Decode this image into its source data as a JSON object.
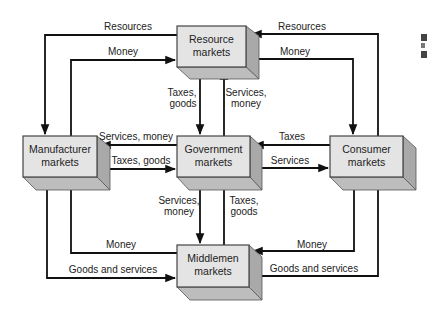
{
  "diagram": {
    "type": "flow",
    "nodes": {
      "resource": {
        "line1": "Resource",
        "line2": "markets"
      },
      "manufacturer": {
        "line1": "Manufacturer",
        "line2": "markets"
      },
      "government": {
        "line1": "Government",
        "line2": "markets"
      },
      "consumer": {
        "line1": "Consumer",
        "line2": "markets"
      },
      "middlemen": {
        "line1": "Middlemen",
        "line2": "markets"
      }
    },
    "edges": {
      "res_to_manu": {
        "label": "Resources",
        "from": "Resource markets",
        "to": "Manufacturer markets"
      },
      "manu_to_res": {
        "label": "Money",
        "from": "Manufacturer markets",
        "to": "Resource markets"
      },
      "cons_to_res": {
        "label": "Resources",
        "from": "Consumer markets",
        "to": "Resource markets"
      },
      "res_to_cons": {
        "label": "Money",
        "from": "Resource markets",
        "to": "Consumer markets"
      },
      "res_to_gov": {
        "line1": "Taxes,",
        "line2": "goods",
        "from": "Resource markets",
        "to": "Government markets"
      },
      "gov_to_res": {
        "line1": "Services,",
        "line2": "money",
        "from": "Government markets",
        "to": "Resource markets"
      },
      "gov_to_manu": {
        "label": "Services, money",
        "from": "Government markets",
        "to": "Manufacturer markets"
      },
      "manu_to_gov": {
        "label": "Taxes, goods",
        "from": "Manufacturer markets",
        "to": "Government markets"
      },
      "cons_to_gov": {
        "label": "Taxes",
        "from": "Consumer markets",
        "to": "Government markets"
      },
      "gov_to_cons": {
        "label": "Services",
        "from": "Government markets",
        "to": "Consumer markets"
      },
      "gov_to_mid": {
        "line1": "Services,",
        "line2": "money",
        "from": "Government markets",
        "to": "Middlemen markets"
      },
      "mid_to_gov": {
        "line1": "Taxes,",
        "line2": "goods",
        "from": "Middlemen markets",
        "to": "Government markets"
      },
      "mid_to_manu": {
        "label": "Money",
        "from": "Middlemen markets",
        "to": "Manufacturer markets"
      },
      "manu_to_mid": {
        "label": "Goods and services",
        "from": "Manufacturer markets",
        "to": "Middlemen markets"
      },
      "cons_to_mid": {
        "label": "Money",
        "from": "Consumer markets",
        "to": "Middlemen markets"
      },
      "mid_to_cons": {
        "label": "Goods and services",
        "from": "Middlemen markets",
        "to": "Consumer markets"
      }
    },
    "colors": {
      "box_front": "#e4e4e4",
      "box_side": "#a9a9a9",
      "box_bottom": "#bdbdbd",
      "line": "#111111"
    }
  }
}
